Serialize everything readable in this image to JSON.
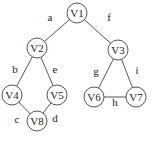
{
  "graph": {
    "stroke_color": "#555555",
    "node_radius": 10,
    "nodes": [
      {
        "id": "V1",
        "label": "V1",
        "x": 77,
        "y": 13
      },
      {
        "id": "V2",
        "label": "V2",
        "x": 37,
        "y": 48
      },
      {
        "id": "V3",
        "label": "V3",
        "x": 118,
        "y": 50
      },
      {
        "id": "V4",
        "label": "V4",
        "x": 12,
        "y": 95
      },
      {
        "id": "V5",
        "label": "V5",
        "x": 57,
        "y": 95
      },
      {
        "id": "V6",
        "label": "V6",
        "x": 94,
        "y": 97
      },
      {
        "id": "V7",
        "label": "V7",
        "x": 136,
        "y": 97
      },
      {
        "id": "V8",
        "label": "V8",
        "x": 37,
        "y": 121
      }
    ],
    "edges": [
      {
        "label": "a",
        "from": "V1",
        "to": "V2",
        "lx": 50,
        "ly": 21
      },
      {
        "label": "f",
        "from": "V1",
        "to": "V3",
        "lx": 109,
        "ly": 21
      },
      {
        "label": "b",
        "from": "V2",
        "to": "V4",
        "lx": 15,
        "ly": 73
      },
      {
        "label": "e",
        "from": "V2",
        "to": "V5",
        "lx": 55,
        "ly": 73
      },
      {
        "label": "c",
        "from": "V4",
        "to": "V8",
        "lx": 17,
        "ly": 123
      },
      {
        "label": "d",
        "from": "V5",
        "to": "V8",
        "lx": 55,
        "ly": 122
      },
      {
        "label": "g",
        "from": "V3",
        "to": "V6",
        "lx": 96,
        "ly": 75
      },
      {
        "label": "i",
        "from": "V3",
        "to": "V7",
        "lx": 137,
        "ly": 74
      },
      {
        "label": "h",
        "from": "V6",
        "to": "V7",
        "lx": 115,
        "ly": 106
      }
    ]
  }
}
